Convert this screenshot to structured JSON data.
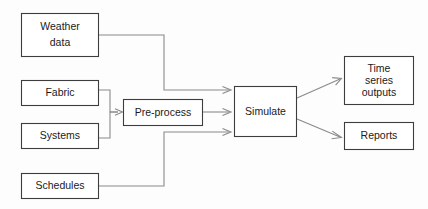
{
  "diagram": {
    "type": "flowchart",
    "title_visible": false,
    "background_color": "#fdfdfd",
    "box_stroke_color": "#3d3d3d",
    "box_fill_color": "#ffffff",
    "connector_color": "#8a8a8a",
    "text_color": "#1a1a1a",
    "nodes": [
      {
        "id": "weather-data",
        "label_lines": [
          "Weather",
          "data"
        ],
        "label": "Weather data",
        "x": 21,
        "y": 13,
        "w": 78,
        "h": 44,
        "role": "input"
      },
      {
        "id": "fabric",
        "label_lines": [
          "Fabric"
        ],
        "label": "Fabric",
        "x": 21,
        "y": 80,
        "w": 78,
        "h": 26,
        "role": "input"
      },
      {
        "id": "systems",
        "label_lines": [
          "Systems"
        ],
        "label": "Systems",
        "x": 21,
        "y": 123,
        "w": 78,
        "h": 26,
        "role": "input"
      },
      {
        "id": "schedules",
        "label_lines": [
          "Schedules"
        ],
        "label": "Schedules",
        "x": 21,
        "y": 173,
        "w": 78,
        "h": 26,
        "role": "input"
      },
      {
        "id": "pre-process",
        "label_lines": [
          "Pre-process"
        ],
        "label": "Pre-process",
        "x": 123,
        "y": 99,
        "w": 80,
        "h": 27,
        "role": "process"
      },
      {
        "id": "simulate",
        "label_lines": [
          "Simulate"
        ],
        "label": "Simulate",
        "x": 234,
        "y": 86,
        "w": 63,
        "h": 51,
        "role": "process"
      },
      {
        "id": "time-series-outputs",
        "label_lines": [
          "Time",
          "series",
          "outputs"
        ],
        "label": "Time series outputs",
        "x": 344,
        "y": 56,
        "w": 70,
        "h": 49,
        "role": "output"
      },
      {
        "id": "reports",
        "label_lines": [
          "Reports"
        ],
        "label": "Reports",
        "x": 344,
        "y": 122,
        "w": 70,
        "h": 28,
        "role": "output"
      }
    ],
    "edges": [
      {
        "id": "weather-to-simulate",
        "from": "weather-data",
        "to": "simulate",
        "style": "orthogonal",
        "arrow": true
      },
      {
        "id": "fabric-to-preprocess",
        "from": "fabric",
        "to": "pre-process",
        "style": "orthogonal",
        "arrow": true
      },
      {
        "id": "systems-to-preprocess",
        "from": "systems",
        "to": "pre-process",
        "style": "orthogonal",
        "arrow": true
      },
      {
        "id": "preprocess-to-simulate",
        "from": "pre-process",
        "to": "simulate",
        "style": "straight",
        "arrow": true
      },
      {
        "id": "schedules-to-simulate",
        "from": "schedules",
        "to": "simulate",
        "style": "orthogonal",
        "arrow": true
      },
      {
        "id": "simulate-to-timeseries",
        "from": "simulate",
        "to": "time-series-outputs",
        "style": "diagonal",
        "arrow": true
      },
      {
        "id": "simulate-to-reports",
        "from": "simulate",
        "to": "reports",
        "style": "diagonal",
        "arrow": true
      }
    ]
  }
}
